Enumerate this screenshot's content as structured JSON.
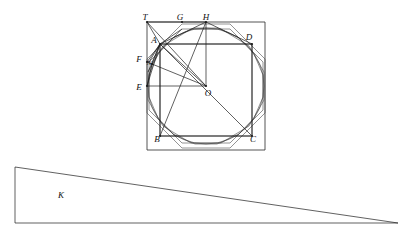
{
  "figure": {
    "stroke_color": "#1d1d1d",
    "background_color": "#ffffff",
    "outer_square": {
      "name": "circumscribed-square",
      "left": 147,
      "top": 22,
      "right": 265,
      "bottom": 150
    },
    "circle": {
      "name": "inscribed-circle",
      "cx": 206,
      "cy": 86,
      "r": 58
    },
    "center": {
      "cx": 206,
      "cy": 86
    },
    "inner_square": {
      "name": "inscribed-square-ABCD",
      "points": "160,44 252,44 252,136 160,136"
    },
    "octagon_inner": {
      "name": "inscribed-octagon",
      "points": "182,29 230,29 263,62 263,110 230,143 182,143 149,110 149,62"
    },
    "octagon_outer": {
      "name": "circumscribed-octagon",
      "points": "182,24 230,24 265,59 265,113 230,148 182,148 147,113 147,59"
    },
    "dodecagon": {
      "name": "inscribed-dodecagon",
      "points": "191,29 221,29 249,46 264,72 264,100 249,126 221,143 191,143 163,126 148,100 148,72 163,46"
    },
    "hexadecagon": {
      "name": "inscribed-sixteen-gon",
      "points": "195,28 217,28 238,37 254,54 263,75 263,97 254,118 238,135 217,144 195,144 174,135 158,118 149,97 149,75 158,54 174,37"
    },
    "labels": [
      {
        "id": "T",
        "text": "T",
        "x": 145,
        "y": 18,
        "anchor_point": "147,22"
      },
      {
        "id": "G",
        "text": "G",
        "x": 180,
        "y": 18,
        "anchor_point": "182,22"
      },
      {
        "id": "H",
        "text": "H",
        "x": 206,
        "y": 18,
        "anchor_point": "206,22"
      },
      {
        "id": "D",
        "text": "D",
        "x": 249,
        "y": 38,
        "anchor_point": "252,44"
      },
      {
        "id": "A",
        "text": "A",
        "x": 154,
        "y": 41,
        "anchor_point": "160,44"
      },
      {
        "id": "F",
        "text": "F",
        "x": 139,
        "y": 60,
        "anchor_point": "147,62"
      },
      {
        "id": "N",
        "text": "N",
        "x": 149,
        "y": 63,
        "anchor_point": "152,64"
      },
      {
        "id": "E",
        "text": "E",
        "x": 139,
        "y": 88,
        "anchor_point": "147,86"
      },
      {
        "id": "O",
        "text": "O",
        "x": 208,
        "y": 94,
        "anchor_point": "206,86"
      },
      {
        "id": "B",
        "text": "B",
        "x": 157,
        "y": 140,
        "anchor_point": "160,136"
      },
      {
        "id": "C",
        "text": "C",
        "x": 253,
        "y": 140,
        "anchor_point": "252,136"
      }
    ],
    "construction_lines": [
      {
        "from": "147,22",
        "to": "206,86",
        "note": "T to O"
      },
      {
        "from": "147,22",
        "to": "160,44",
        "note": "T to A"
      },
      {
        "from": "160,44",
        "to": "206,86",
        "note": "A to O"
      },
      {
        "from": "160,44",
        "to": "206,22",
        "note": "A to H"
      },
      {
        "from": "160,44",
        "to": "182,29",
        "note": "A to G-vertex"
      },
      {
        "from": "160,44",
        "to": "147,62",
        "note": "A to F"
      },
      {
        "from": "160,44",
        "to": "147,86",
        "note": "A to E"
      },
      {
        "from": "160,44",
        "to": "149,62",
        "note": "A to octagon vertex"
      },
      {
        "from": "160,44",
        "to": "152,64",
        "note": "A to N"
      },
      {
        "from": "160,44",
        "to": "148,72",
        "note": "A to dodecagon vertex"
      },
      {
        "from": "160,44",
        "to": "252,136",
        "note": "A to C diagonal"
      },
      {
        "from": "160,44",
        "to": "252,44",
        "note": "A to D"
      },
      {
        "from": "206,22",
        "to": "206,86",
        "note": "H to O"
      },
      {
        "from": "206,22",
        "to": "160,136",
        "note": "H to B"
      },
      {
        "from": "206,22",
        "to": "252,44",
        "note": "H to D"
      },
      {
        "from": "206,22",
        "to": "147,22",
        "note": "H to T"
      },
      {
        "from": "147,86",
        "to": "206,86",
        "note": "E to O"
      },
      {
        "from": "147,86",
        "to": "152,64",
        "note": "E to N"
      },
      {
        "from": "147,62",
        "to": "152,64",
        "note": "F to N"
      },
      {
        "from": "152,64",
        "to": "206,86",
        "note": "N to O"
      },
      {
        "from": "160,44",
        "to": "160,136",
        "note": "A to B"
      },
      {
        "from": "252,44",
        "to": "252,136",
        "note": "D to C"
      },
      {
        "from": "160,136",
        "to": "252,136",
        "note": "B to C"
      }
    ]
  },
  "triangle": {
    "name": "auxiliary-triangle-K",
    "label": "K",
    "label_x": 61,
    "label_y": 196,
    "points": "15,167 15,223 398,223",
    "apex_top_left": {
      "x": 15,
      "y": 167
    },
    "bottom_left": {
      "x": 15,
      "y": 223
    },
    "bottom_right": {
      "x": 398,
      "y": 223
    }
  }
}
